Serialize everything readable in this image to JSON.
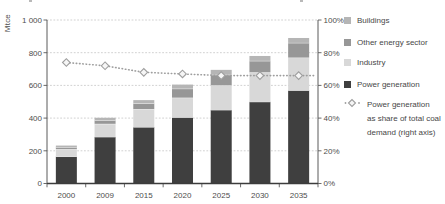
{
  "chart_data": {
    "type": "bar",
    "subtype": "stacked-bars-with-share-line",
    "categories": [
      "2000",
      "2009",
      "2015",
      "2020",
      "2025",
      "2030",
      "2035"
    ],
    "series": [
      {
        "name": "Power generation",
        "color": "#3f3f3f",
        "values": [
          165,
          285,
          345,
          405,
          450,
          500,
          570
        ]
      },
      {
        "name": "Industry",
        "color": "#d8d8d8",
        "values": [
          45,
          80,
          110,
          120,
          150,
          180,
          200
        ]
      },
      {
        "name": "Other energy sector",
        "color": "#979797",
        "values": [
          12,
          22,
          35,
          55,
          65,
          70,
          90
        ]
      },
      {
        "name": "Buildings",
        "color": "#b5b5b5",
        "values": [
          10,
          15,
          20,
          25,
          30,
          30,
          30
        ]
      }
    ],
    "totals": [
      232,
      402,
      510,
      605,
      695,
      780,
      890
    ],
    "line_series": {
      "name": "Power generation as share of total coal demand (right axis)",
      "axis": "right",
      "marker": "diamond",
      "line_color": "#9e9e9e",
      "marker_fill": "#f6f6f6",
      "values": [
        74,
        72,
        68,
        67,
        66,
        66,
        66
      ]
    },
    "left_axis": {
      "label": "Mtce",
      "range": [
        0,
        1000
      ],
      "ticks": [
        "0",
        "200",
        "400",
        "600",
        "800",
        "1 000"
      ]
    },
    "right_axis": {
      "range": [
        0,
        100
      ],
      "ticks": [
        "0%",
        "20%",
        "40%",
        "60%",
        "80%",
        "100%"
      ]
    },
    "grid": true,
    "grid_style": "dotted",
    "legend_position": "right",
    "colors": {
      "grid": "#cccccc",
      "axis": "#5a5a5a",
      "baseline": "#3c3c3c",
      "tick_text": "#4d4d4d"
    }
  },
  "legend": {
    "items": [
      {
        "key": "buildings",
        "label": "Buildings",
        "swatch": "#b5b5b5",
        "type": "square"
      },
      {
        "key": "other-energy-sector",
        "label": "Other energy sector",
        "swatch": "#979797",
        "type": "square"
      },
      {
        "key": "industry",
        "label": "Industry",
        "swatch": "#d8d8d8",
        "type": "square"
      },
      {
        "key": "power-generation",
        "label": "Power generation",
        "swatch": "#3f3f3f",
        "type": "square"
      },
      {
        "key": "share-line",
        "type": "line-marker",
        "label_lines": [
          "Power generation",
          "as share of total coal",
          "demand (right axis)"
        ],
        "line_color": "#9e9e9e",
        "marker_fill": "#f6f6f6"
      }
    ]
  }
}
